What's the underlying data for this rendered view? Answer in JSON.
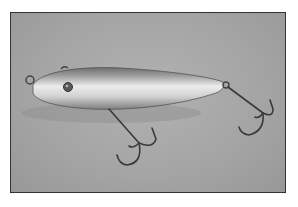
{
  "image": {
    "subject": "Fishing lure with two treble hooks on gray background",
    "alt": "Silver torpedo-shaped fishing lure with eye, line tie and two treble hooks",
    "colors": {
      "background": "#a8a8a8",
      "border": "#333333",
      "body_light": "#e6e6e6",
      "body_dark": "#7a7a7a",
      "hook": "#3a3a3a"
    }
  }
}
